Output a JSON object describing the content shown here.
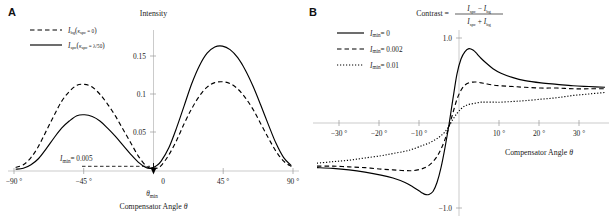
{
  "figure": {
    "panelA_letter": "A",
    "panelB_letter": "B"
  },
  "panelA": {
    "y_axis_title": "Intensity",
    "x_axis_title_prefix": "Compensator Angle ",
    "x_axis_title_symbol": "θ",
    "y_ticks": [
      "0.05",
      "0.1",
      "0.15"
    ],
    "y_tick_values": [
      0.05,
      0.1,
      0.15
    ],
    "x_ticks": [
      "−90 °",
      "−45 °",
      "0",
      "45 °",
      "90 °"
    ],
    "x_tick_values": [
      -90,
      -45,
      0,
      45,
      90
    ],
    "legend": [
      {
        "style": "dashed",
        "symbol": "I",
        "sub": "bg",
        "paren_open": "(",
        "kappa": "κ",
        "kappa_sub": "spc",
        "eq": " = 0",
        "paren_close": ")"
      },
      {
        "style": "solid",
        "symbol": "I",
        "sub": "spc",
        "paren_open": "(",
        "kappa": "κ",
        "kappa_sub": "spc",
        "eq": " = λ/50",
        "paren_close": ")"
      }
    ],
    "annotation_imin": {
      "symbol": "I",
      "sub": "min",
      "eq": "= 0.005",
      "value": 0.005
    },
    "annotation_thetamin": {
      "symbol": "θ",
      "sub": "min"
    }
  },
  "panelB": {
    "y_axis_title": {
      "lead": "Contrast = ",
      "num_a": "I",
      "num_a_sub": "spc",
      "minus": " − ",
      "num_b": "I",
      "num_b_sub": "bg",
      "den_a": "I",
      "den_a_sub": "spc",
      "plus": " + ",
      "den_b": "I",
      "den_b_sub": "bg"
    },
    "x_axis_title_prefix": "Compensator Angle ",
    "x_axis_title_symbol": "θ",
    "y_ticks": [
      "1.0",
      "−1.0"
    ],
    "y_tick_values": [
      1.0,
      -1.0
    ],
    "x_ticks": [
      "−30 °",
      "−20 °",
      "−10 °",
      "10 °",
      "20 °",
      "30 °"
    ],
    "x_tick_values": [
      -30,
      -20,
      -10,
      10,
      20,
      30
    ],
    "legend": [
      {
        "style": "solid",
        "symbol": "I",
        "sub": "min",
        "eq": "= 0",
        "value": 0
      },
      {
        "style": "dashed",
        "symbol": "I",
        "sub": "min",
        "eq": "= 0.002",
        "value": 0.002
      },
      {
        "style": "dotted",
        "symbol": "I",
        "sub": "min",
        "eq": "= 0.01",
        "value": 0.01
      }
    ]
  },
  "chart_data": [
    {
      "type": "line",
      "panel": "A",
      "title": "Intensity vs Compensator Angle",
      "xlabel": "Compensator Angle θ",
      "ylabel": "Intensity",
      "xlim": [
        -95,
        95
      ],
      "ylim": [
        0,
        0.158
      ],
      "xticks": [
        -90,
        -45,
        0,
        45,
        90
      ],
      "yticks": [
        0.05,
        0.1,
        0.15
      ],
      "grid": false,
      "legend_position": "top-left",
      "annotations": [
        {
          "text": "I_min = 0.005",
          "y": 0.005
        },
        {
          "text": "θ_min",
          "x": -2
        }
      ],
      "x": [
        -90,
        -85,
        -80,
        -75,
        -70,
        -65,
        -60,
        -55,
        -50,
        -45,
        -40,
        -35,
        -30,
        -25,
        -20,
        -15,
        -10,
        -5,
        -2,
        0,
        2,
        5,
        10,
        15,
        20,
        25,
        30,
        35,
        40,
        45,
        50,
        55,
        60,
        65,
        70,
        75,
        80,
        85,
        90
      ],
      "series": [
        {
          "name": "I_bg(κ_spc = 0)",
          "style": "dashed",
          "values": [
            0.004,
            0.007,
            0.015,
            0.028,
            0.045,
            0.062,
            0.078,
            0.089,
            0.096,
            0.097,
            0.094,
            0.086,
            0.075,
            0.062,
            0.047,
            0.032,
            0.017,
            0.006,
            0.003,
            0.002,
            0.003,
            0.006,
            0.018,
            0.034,
            0.053,
            0.07,
            0.084,
            0.094,
            0.099,
            0.1,
            0.098,
            0.092,
            0.082,
            0.069,
            0.053,
            0.037,
            0.022,
            0.011,
            0.005
          ]
        },
        {
          "name": "I_spc(κ_spc = λ/50)",
          "style": "solid",
          "values": [
            0.002,
            0.003,
            0.007,
            0.014,
            0.025,
            0.037,
            0.048,
            0.056,
            0.062,
            0.063,
            0.061,
            0.056,
            0.048,
            0.039,
            0.029,
            0.019,
            0.01,
            0.004,
            0.003,
            0.004,
            0.006,
            0.011,
            0.026,
            0.048,
            0.073,
            0.098,
            0.118,
            0.132,
            0.139,
            0.14,
            0.136,
            0.127,
            0.113,
            0.095,
            0.074,
            0.052,
            0.031,
            0.015,
            0.006
          ]
        }
      ]
    },
    {
      "type": "line",
      "panel": "B",
      "title": "Contrast vs Compensator Angle",
      "xlabel": "Compensator Angle θ",
      "ylabel": "Contrast = (I_spc − I_bg)/(I_spc + I_bg)",
      "xlim": [
        -37,
        37
      ],
      "ylim": [
        -1.25,
        1.25
      ],
      "xticks": [
        -30,
        -20,
        -10,
        10,
        20,
        30
      ],
      "yticks": [
        -1.0,
        1.0
      ],
      "grid": false,
      "legend_position": "top-left",
      "x": [
        -36,
        -32,
        -28,
        -24,
        -20,
        -17,
        -14,
        -12,
        -10,
        -9,
        -8,
        -7,
        -6,
        -5,
        -4,
        -3,
        -2,
        -1,
        0,
        1,
        2,
        3,
        4,
        5,
        6,
        8,
        10,
        13,
        16,
        20,
        24,
        28,
        32,
        36
      ],
      "series": [
        {
          "name": "I_min = 0",
          "style": "solid",
          "values": [
            -0.6,
            -0.61,
            -0.63,
            -0.66,
            -0.7,
            -0.74,
            -0.8,
            -0.86,
            -0.93,
            -0.96,
            -0.96,
            -0.92,
            -0.8,
            -0.6,
            -0.33,
            -0.02,
            0.33,
            0.66,
            0.86,
            0.96,
            1.0,
            0.98,
            0.93,
            0.87,
            0.82,
            0.73,
            0.67,
            0.61,
            0.57,
            0.54,
            0.52,
            0.5,
            0.49,
            0.48
          ]
        },
        {
          "name": "I_min = 0.002",
          "style": "dashed",
          "values": [
            -0.58,
            -0.58,
            -0.59,
            -0.6,
            -0.62,
            -0.63,
            -0.64,
            -0.64,
            -0.62,
            -0.6,
            -0.57,
            -0.52,
            -0.45,
            -0.35,
            -0.22,
            -0.05,
            0.14,
            0.32,
            0.44,
            0.51,
            0.54,
            0.55,
            0.55,
            0.54,
            0.53,
            0.51,
            0.5,
            0.49,
            0.48,
            0.47,
            0.47,
            0.46,
            0.46,
            0.46
          ]
        },
        {
          "name": "I_min = 0.01",
          "style": "dotted",
          "values": [
            -0.54,
            -0.52,
            -0.5,
            -0.47,
            -0.44,
            -0.41,
            -0.38,
            -0.35,
            -0.31,
            -0.29,
            -0.27,
            -0.24,
            -0.21,
            -0.17,
            -0.12,
            -0.04,
            0.05,
            0.13,
            0.19,
            0.23,
            0.25,
            0.26,
            0.27,
            0.28,
            0.28,
            0.28,
            0.28,
            0.29,
            0.3,
            0.32,
            0.34,
            0.37,
            0.39,
            0.41
          ]
        }
      ]
    }
  ]
}
